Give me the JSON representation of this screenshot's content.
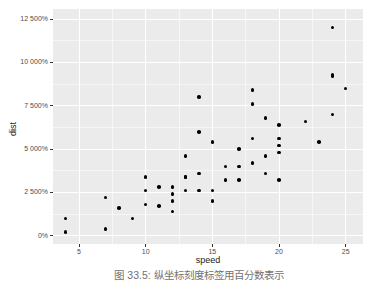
{
  "figure": {
    "caption": "图 33.5: 纵坐标刻度标签用百分数表示"
  },
  "colors": {
    "panel_background": "#ebebeb",
    "grid_major": "#ffffff",
    "grid_minor_faint_white": "rgba(255,255,255,0.55)",
    "point": "#000000",
    "axis_tick_text": "#4d4d4d",
    "axis_title": "#1a1a1a",
    "page_background": "#ffffff"
  },
  "chart_data": {
    "type": "scatter",
    "title": "",
    "xlabel": "speed",
    "ylabel": "dist",
    "legend": "none",
    "grid": "ggplot2 theme_gray: gray panel, white major gridlines, faint white minor gridlines",
    "x_ticks": [
      5,
      10,
      15,
      20,
      25
    ],
    "x_tick_labels": [
      "5",
      "10",
      "15",
      "20",
      "25"
    ],
    "y_ticks_percent": [
      0,
      2500,
      5000,
      7500,
      10000,
      12500
    ],
    "y_tick_labels": [
      "0%",
      "2 500%",
      "5 000%",
      "7 500%",
      "10 000%",
      "12 500%"
    ],
    "x_minor_step": 2.5,
    "y_minor_step_percent": 1250,
    "xlim": [
      3.05,
      26.3
    ],
    "ylim_percent": [
      -477,
      13078
    ],
    "y_display_rule": "dist value rendered as dist*100 with % suffix and space big-mark",
    "series": [
      {
        "name": "cars",
        "x_speed": [
          4,
          4,
          7,
          7,
          8,
          9,
          10,
          10,
          10,
          11,
          11,
          12,
          12,
          12,
          12,
          13,
          13,
          13,
          13,
          14,
          14,
          14,
          14,
          15,
          15,
          15,
          16,
          16,
          17,
          17,
          17,
          18,
          18,
          18,
          18,
          19,
          19,
          19,
          20,
          20,
          20,
          20,
          20,
          22,
          23,
          24,
          24,
          24,
          24,
          25
        ],
        "y_dist": [
          2,
          10,
          4,
          22,
          16,
          10,
          18,
          26,
          34,
          17,
          28,
          14,
          20,
          24,
          28,
          26,
          34,
          34,
          46,
          26,
          36,
          60,
          80,
          20,
          26,
          54,
          32,
          40,
          32,
          40,
          50,
          42,
          56,
          76,
          84,
          36,
          46,
          68,
          32,
          48,
          52,
          56,
          64,
          66,
          54,
          70,
          92,
          93,
          120,
          85
        ]
      }
    ]
  }
}
